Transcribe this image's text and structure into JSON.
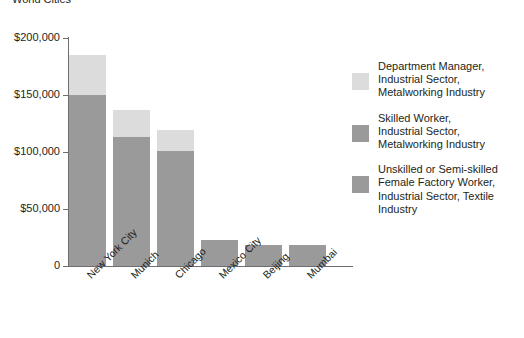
{
  "chart_data": {
    "type": "bar",
    "stacked": true,
    "title": "World Cities",
    "xlabel": "",
    "ylabel": "",
    "ylim": [
      0,
      200000
    ],
    "grid": false,
    "legend_position": "right",
    "categories": [
      "New York City",
      "Munich",
      "Chicago",
      "Mexico City",
      "Beijing",
      "Mumbai"
    ],
    "ytick_labels": [
      "$200,000",
      "$150,000",
      "$100,000",
      "$50,000",
      "0"
    ],
    "ytick_values": [
      200000,
      150000,
      100000,
      50000,
      0
    ],
    "series": [
      {
        "name": "Unskilled or Semi-skilled Female Factory Worker, Industrial Sector, Textile Industry",
        "color": "#9a9a9a",
        "values": [
          0,
          0,
          0,
          23000,
          18000,
          18000
        ]
      },
      {
        "name": "Skilled Worker, Industrial Sector, Metalworking Industry",
        "color": "#9a9a9a",
        "values": [
          150000,
          113000,
          101000,
          0,
          0,
          0
        ]
      },
      {
        "name": "Department Manager, Industrial Sector, Metalworking Industry",
        "color": "#dcdcdc",
        "values": [
          35000,
          24000,
          18000,
          0,
          0,
          0
        ]
      }
    ],
    "totals": [
      185000,
      137000,
      119000,
      23000,
      18000,
      18000
    ]
  },
  "legend": {
    "items": [
      {
        "label": "Department Manager,\nIndustrial Sector,\nMetalworking Industry",
        "color": "#dcdcdc"
      },
      {
        "label": "Skilled Worker,\nIndustrial Sector,\nMetalworking Industry",
        "color": "#9a9a9a"
      },
      {
        "label": "Unskilled or Semi-skilled\nFemale Factory Worker,\nIndustrial Sector, Textile\nIndustry",
        "color": "#9a9a9a"
      }
    ]
  },
  "colors": {
    "light_gray": "#dcdcdc",
    "medium_gray": "#9a9a9a",
    "axis": "#6d6e71",
    "text": "#231f20",
    "background": "#ffffff"
  }
}
